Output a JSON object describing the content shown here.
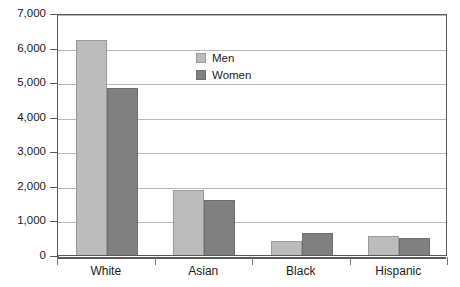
{
  "chart_data": {
    "type": "bar",
    "title": "",
    "subtitle": "",
    "xlabel": "",
    "ylabel": "",
    "categories": [
      "White",
      "Asian",
      "Black",
      "Hispanic"
    ],
    "series": [
      {
        "name": "Men",
        "color": "#bcbcbc",
        "values": [
          6230,
          1890,
          400,
          540
        ]
      },
      {
        "name": "Women",
        "color": "#808080",
        "values": [
          4830,
          1600,
          650,
          480
        ]
      }
    ],
    "ylim": [
      0,
      7000
    ],
    "ytick_values": [
      0,
      1000,
      2000,
      3000,
      4000,
      5000,
      6000,
      7000
    ],
    "ytick_labels": [
      "0",
      "1,000",
      "2,000",
      "3,000",
      "4,000",
      "5,000",
      "6,000",
      "7,000"
    ],
    "grid": true,
    "legend_position": "inside-top-center",
    "legend_entries": [
      "Men",
      "Women"
    ]
  }
}
